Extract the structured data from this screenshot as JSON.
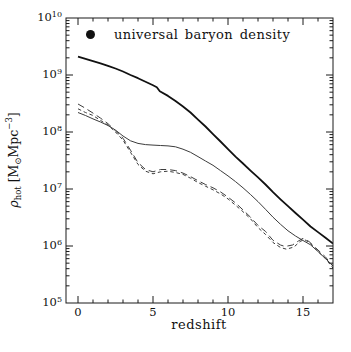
{
  "figure": {
    "legend": {
      "marker": "filled-circle",
      "label": "universal baryon density"
    },
    "x_axis": {
      "label": "redshift",
      "tick_labels": [
        "0",
        "5",
        "10",
        "15"
      ]
    },
    "y_axis": {
      "label_text": "ρ_hot [M⊙Mpc−3]",
      "label_parts": {
        "rho": "ρ",
        "sub": "hot",
        "open": " [M",
        "odot": "⊙",
        "unit": "Mpc",
        "exp": "−3",
        "close": "]"
      },
      "tick_base": "10",
      "tick_exponents": [
        10,
        9,
        8,
        7,
        6,
        5
      ]
    }
  },
  "chart_data": {
    "type": "line",
    "title": "",
    "xlabel": "redshift",
    "ylabel": "rho_hot [M_sun Mpc^-3]",
    "x_scale": "linear",
    "y_scale": "log",
    "xlim": [
      -0.8,
      17
    ],
    "ylim": [
      100000.0,
      10000000000.0
    ],
    "x_major_ticks": [
      0,
      5,
      10,
      15
    ],
    "x_minor_step": 1,
    "grid": false,
    "legend_position": "top-left-inside",
    "ink_color": "#1a1a1a",
    "legend": [
      {
        "marker": "filled-circle",
        "label": "universal baryon density"
      }
    ],
    "series": [
      {
        "id": "thick-solid",
        "line_style": "solid",
        "weight": "thick",
        "points": [
          [
            0,
            2100000000.0
          ],
          [
            0.5,
            1920000000.0
          ],
          [
            1,
            1750000000.0
          ],
          [
            1.5,
            1600000000.0
          ],
          [
            2,
            1450000000.0
          ],
          [
            2.5,
            1300000000.0
          ],
          [
            3,
            1150000000.0
          ],
          [
            3.5,
            1000000000.0
          ],
          [
            4,
            880000000.0
          ],
          [
            4.5,
            760000000.0
          ],
          [
            5,
            660000000.0
          ],
          [
            5.25,
            610000000.0
          ],
          [
            5.45,
            520000000.0
          ],
          [
            6,
            430000000.0
          ],
          [
            6.5,
            350000000.0
          ],
          [
            7,
            280000000.0
          ],
          [
            7.5,
            220000000.0
          ],
          [
            8,
            165000000.0
          ],
          [
            8.5,
            125000000.0
          ],
          [
            9,
            92000000.0
          ],
          [
            9.5,
            68000000.0
          ],
          [
            10,
            50000000.0
          ],
          [
            10.5,
            37000000.0
          ],
          [
            11,
            28000000.0
          ],
          [
            11.5,
            21000000.0
          ],
          [
            12,
            16000000.0
          ],
          [
            12.5,
            12000000.0
          ],
          [
            13,
            8800000.0
          ],
          [
            13.5,
            6600000.0
          ],
          [
            14,
            5000000.0
          ],
          [
            14.5,
            3800000.0
          ],
          [
            15,
            2900000.0
          ],
          [
            15.5,
            2200000.0
          ],
          [
            16,
            1750000.0
          ],
          [
            16.5,
            1400000.0
          ],
          [
            17,
            1100000.0
          ]
        ]
      },
      {
        "id": "thin-solid",
        "line_style": "solid",
        "weight": "thin",
        "points": [
          [
            0,
            220000000.0
          ],
          [
            0.5,
            195000000.0
          ],
          [
            1,
            170000000.0
          ],
          [
            1.5,
            150000000.0
          ],
          [
            2,
            130000000.0
          ],
          [
            2.5,
            108000000.0
          ],
          [
            3,
            85000000.0
          ],
          [
            3.5,
            70000000.0
          ],
          [
            4,
            63000000.0
          ],
          [
            4.5,
            60000000.0
          ],
          [
            5,
            59000000.0
          ],
          [
            5.5,
            58000000.0
          ],
          [
            6,
            57000000.0
          ],
          [
            6.5,
            55000000.0
          ],
          [
            7,
            50000000.0
          ],
          [
            7.5,
            44000000.0
          ],
          [
            8,
            37000000.0
          ],
          [
            8.5,
            31000000.0
          ],
          [
            9,
            26000000.0
          ],
          [
            9.5,
            21000000.0
          ],
          [
            10,
            17000000.0
          ],
          [
            10.5,
            13500000.0
          ],
          [
            11,
            10500000.0
          ],
          [
            11.5,
            8000000.0
          ],
          [
            12,
            6000000.0
          ],
          [
            12.5,
            4400000.0
          ],
          [
            13,
            3200000.0
          ],
          [
            13.5,
            2400000.0
          ],
          [
            14,
            1850000.0
          ],
          [
            14.5,
            1500000.0
          ],
          [
            15,
            1250000.0
          ],
          [
            15.5,
            1050000.0
          ],
          [
            16,
            800000.0
          ],
          [
            16.5,
            600000.0
          ],
          [
            17,
            450000.0
          ]
        ]
      },
      {
        "id": "long-dashed",
        "line_style": "long-dash",
        "weight": "thin",
        "points": [
          [
            0,
            310000000.0
          ],
          [
            0.5,
            260000000.0
          ],
          [
            1,
            215000000.0
          ],
          [
            1.5,
            175000000.0
          ],
          [
            2,
            140000000.0
          ],
          [
            2.5,
            105000000.0
          ],
          [
            3,
            78000000.0
          ],
          [
            3.5,
            48000000.0
          ],
          [
            4,
            29000000.0
          ],
          [
            4.5,
            22000000.0
          ],
          [
            5,
            20000000.0
          ],
          [
            5.5,
            22000000.0
          ],
          [
            6,
            22000000.0
          ],
          [
            6.5,
            21000000.0
          ],
          [
            7,
            19000000.0
          ],
          [
            7.5,
            16500000.0
          ],
          [
            8,
            14000000.0
          ],
          [
            8.5,
            12000000.0
          ],
          [
            9,
            10500000.0
          ],
          [
            9.5,
            8900000.0
          ],
          [
            10,
            7200000.0
          ],
          [
            10.5,
            5700000.0
          ],
          [
            11,
            4300000.0
          ],
          [
            11.5,
            3200000.0
          ],
          [
            12,
            2300000.0
          ],
          [
            12.5,
            1800000.0
          ],
          [
            13,
            1260000.0
          ],
          [
            13.5,
            1040000.0
          ],
          [
            13.8,
            980000.0
          ],
          [
            14.3,
            1040000.0
          ],
          [
            14.7,
            1230000.0
          ],
          [
            15,
            1360000.0
          ],
          [
            15.4,
            1200000.0
          ],
          [
            16,
            850000.0
          ],
          [
            16.5,
            640000.0
          ],
          [
            17,
            440000.0
          ]
        ]
      },
      {
        "id": "short-dashed",
        "line_style": "short-dash",
        "weight": "thin",
        "points": [
          [
            0,
            255000000.0
          ],
          [
            0.5,
            220000000.0
          ],
          [
            1,
            195000000.0
          ],
          [
            1.5,
            160000000.0
          ],
          [
            2,
            132000000.0
          ],
          [
            2.5,
            100000000.0
          ],
          [
            3,
            72000000.0
          ],
          [
            3.5,
            44000000.0
          ],
          [
            4,
            27000000.0
          ],
          [
            4.5,
            20500000.0
          ],
          [
            5,
            18500000.0
          ],
          [
            5.5,
            20000000.0
          ],
          [
            6,
            20500000.0
          ],
          [
            6.5,
            19500000.0
          ],
          [
            7,
            18000000.0
          ],
          [
            7.5,
            15500000.0
          ],
          [
            8,
            13000000.0
          ],
          [
            8.5,
            11200000.0
          ],
          [
            9,
            9700000.0
          ],
          [
            9.5,
            8200000.0
          ],
          [
            10,
            6700000.0
          ],
          [
            10.5,
            5200000.0
          ],
          [
            11,
            4000000.0
          ],
          [
            11.5,
            3000000.0
          ],
          [
            12,
            2100000.0
          ],
          [
            12.5,
            1600000.0
          ],
          [
            13,
            1150000.0
          ],
          [
            13.5,
            940000.0
          ],
          [
            13.9,
            880000.0
          ],
          [
            14.4,
            960000.0
          ],
          [
            14.8,
            1200000.0
          ],
          [
            15.1,
            1300000.0
          ],
          [
            15.5,
            1100000.0
          ],
          [
            16,
            800000.0
          ],
          [
            16.5,
            600000.0
          ],
          [
            17,
            410000.0
          ]
        ]
      }
    ]
  }
}
